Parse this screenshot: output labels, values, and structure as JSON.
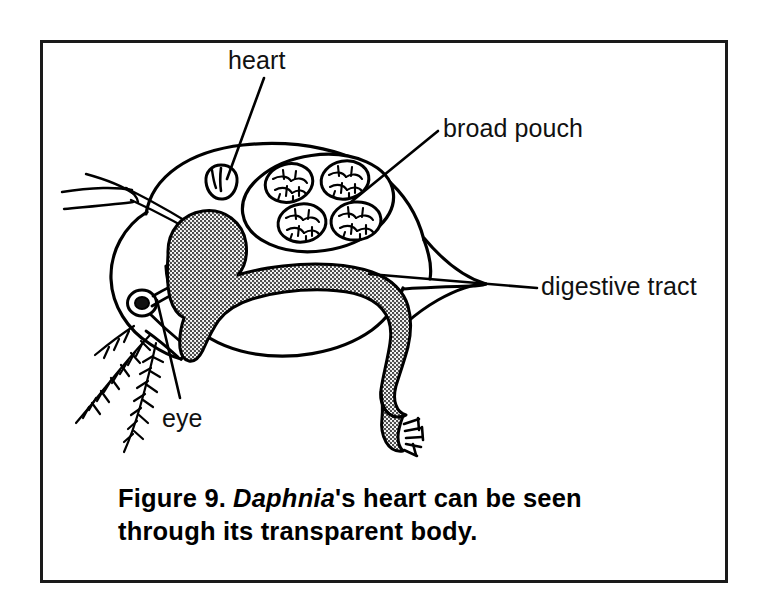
{
  "figure": {
    "caption_prefix": "Figure 9.",
    "caption_genus": "Daphnia",
    "caption_rest": "'s heart can be seen through its transparent body.",
    "frame_color": "#1a1a1a",
    "background_color": "#ffffff",
    "ink_color": "#000000",
    "organ_fill_color": "#8a8a8a"
  },
  "labels": {
    "heart": "heart",
    "broad_pouch": "broad pouch",
    "digestive_tract": "digestive tract",
    "eye": "eye"
  },
  "diagram": {
    "parts": [
      {
        "name": "heart",
        "description": "small rounded organ in dorsal anterior carapace"
      },
      {
        "name": "broad pouch",
        "description": "brood chamber containing four developing eggs"
      },
      {
        "name": "digestive tract",
        "description": "shaded gut running from head through postabdomen"
      },
      {
        "name": "eye",
        "description": "single dark compound eye in head"
      },
      {
        "name": "antennae",
        "description": "branched swimming antennae with setae"
      },
      {
        "name": "carapace",
        "description": "transparent bivalved shell with tail spine"
      }
    ],
    "egg_count": 4
  }
}
